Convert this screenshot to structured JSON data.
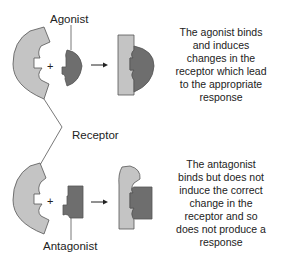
{
  "labels": {
    "agonist": "Agonist",
    "receptor": "Receptor",
    "antagonist": "Antagonist"
  },
  "descriptions": {
    "agonist": [
      "The agonist binds",
      "and induces",
      "changes in the",
      "receptor which lead",
      "to the appropriate",
      "response"
    ],
    "antagonist": [
      "The antagonist",
      "binds but does not",
      "induce the correct",
      "change in the",
      "receptor and so",
      "does not produce a",
      "response"
    ]
  },
  "symbols": {
    "plus": "+",
    "arrow": "→"
  },
  "colors": {
    "receptor_fill": "#c4c4c4",
    "ligand_fill": "#6e6e6e",
    "outline": "#555555",
    "text": "#222222"
  }
}
